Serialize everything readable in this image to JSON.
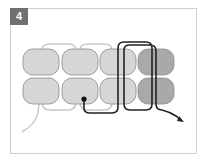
{
  "step": {
    "number": "4"
  },
  "colors": {
    "bead_light": "#d6d6d6",
    "bead_dark": "#a9a9a9",
    "bead_outline": "#8a8a8a",
    "thread_old": "#c8c8c8",
    "thread_active": "#222222",
    "badge": "#707070"
  },
  "diagram": {
    "rows": 2,
    "columns": 4,
    "dark_column": 4,
    "start_marker": "dot",
    "end_marker": "arrow"
  }
}
